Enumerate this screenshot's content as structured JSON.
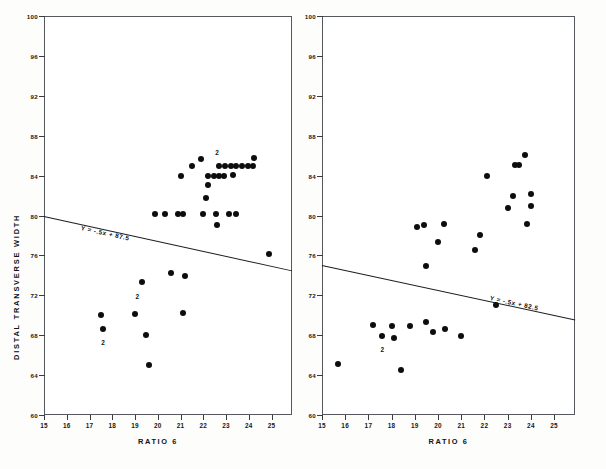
{
  "figure": {
    "background_color": "#ffffff",
    "point_color": "#0d0d0d",
    "axis_color": "#3a3d40"
  },
  "chart_data": [
    {
      "type": "scatter",
      "panel": "left",
      "title": "",
      "xlabel": "RATIO 6",
      "ylabel": "DISTAL TRANSVERSE WIDTH",
      "xlim": [
        15,
        25.9
      ],
      "ylim": [
        60,
        100
      ],
      "xticks": [
        15,
        16,
        17,
        18,
        19,
        20,
        21,
        22,
        23,
        24,
        25
      ],
      "yticks": [
        60,
        64,
        68,
        72,
        76,
        80,
        84,
        88,
        92,
        96,
        100
      ],
      "grid": false,
      "legend": null,
      "annotations": [
        {
          "text": "Y = -.5x + 87.5",
          "x": 16.6,
          "y": 79.0
        }
      ],
      "trendline": {
        "equation": "Y = -.5x + 87.5",
        "slope": -0.5,
        "intercept": 87.5,
        "x_start": 15.0,
        "y_start": 80.0,
        "x_end": 25.9,
        "y_end": 74.55
      },
      "points": [
        {
          "x": 17.5,
          "y": 70.0,
          "n": 1
        },
        {
          "x": 17.6,
          "y": 68.6,
          "n": 2,
          "count_label": "2"
        },
        {
          "x": 19.0,
          "y": 70.1,
          "n": 1
        },
        {
          "x": 19.3,
          "y": 73.3,
          "n": 1,
          "count_label": "2"
        },
        {
          "x": 19.5,
          "y": 68.0,
          "n": 1
        },
        {
          "x": 19.6,
          "y": 65.0,
          "n": 1
        },
        {
          "x": 19.9,
          "y": 80.2,
          "n": 1
        },
        {
          "x": 20.3,
          "y": 80.2,
          "n": 1
        },
        {
          "x": 20.6,
          "y": 74.2,
          "n": 1
        },
        {
          "x": 20.9,
          "y": 80.2,
          "n": 1
        },
        {
          "x": 21.1,
          "y": 80.2,
          "n": 1
        },
        {
          "x": 21.2,
          "y": 73.9,
          "n": 1
        },
        {
          "x": 21.1,
          "y": 70.2,
          "n": 1
        },
        {
          "x": 21.0,
          "y": 84.0,
          "n": 1
        },
        {
          "x": 21.5,
          "y": 85.0,
          "n": 1
        },
        {
          "x": 21.9,
          "y": 85.7,
          "n": 1
        },
        {
          "x": 22.2,
          "y": 83.1,
          "n": 1
        },
        {
          "x": 22.1,
          "y": 81.8,
          "n": 1
        },
        {
          "x": 22.2,
          "y": 84.0,
          "n": 1
        },
        {
          "x": 22.45,
          "y": 84.0,
          "n": 1
        },
        {
          "x": 22.7,
          "y": 84.0,
          "n": 1
        },
        {
          "x": 22.9,
          "y": 84.0,
          "n": 1
        },
        {
          "x": 22.55,
          "y": 80.2,
          "n": 1
        },
        {
          "x": 22.6,
          "y": 79.0,
          "n": 1
        },
        {
          "x": 22.0,
          "y": 80.2,
          "n": 1
        },
        {
          "x": 22.7,
          "y": 85.0,
          "n": 2,
          "count_label": "2"
        },
        {
          "x": 22.95,
          "y": 85.0,
          "n": 1
        },
        {
          "x": 23.2,
          "y": 85.0,
          "n": 1
        },
        {
          "x": 23.45,
          "y": 85.0,
          "n": 1
        },
        {
          "x": 23.7,
          "y": 85.0,
          "n": 1
        },
        {
          "x": 23.95,
          "y": 85.0,
          "n": 1
        },
        {
          "x": 24.2,
          "y": 85.0,
          "n": 1
        },
        {
          "x": 24.25,
          "y": 85.8,
          "n": 1
        },
        {
          "x": 23.3,
          "y": 84.1,
          "n": 1
        },
        {
          "x": 23.15,
          "y": 80.2,
          "n": 1
        },
        {
          "x": 23.45,
          "y": 80.2,
          "n": 1
        },
        {
          "x": 24.9,
          "y": 76.1,
          "n": 1
        }
      ],
      "count_markers": [
        {
          "text": "2",
          "x": 22.6,
          "y": 86.4
        },
        {
          "text": "2",
          "x": 19.1,
          "y": 71.9
        },
        {
          "text": "2",
          "x": 17.6,
          "y": 67.3
        }
      ]
    },
    {
      "type": "scatter",
      "panel": "right",
      "title": "",
      "xlabel": "RATIO 6",
      "ylabel": "",
      "xlim": [
        15,
        25.9
      ],
      "ylim": [
        60,
        100
      ],
      "xticks": [
        15,
        16,
        17,
        18,
        19,
        20,
        21,
        22,
        23,
        24,
        25
      ],
      "yticks": [
        60,
        64,
        68,
        72,
        76,
        80,
        84,
        88,
        92,
        96,
        100
      ],
      "grid": false,
      "legend": null,
      "annotations": [
        {
          "text": "Y = -.5x + 82.5",
          "x": 22.2,
          "y": 72.0
        }
      ],
      "trendline": {
        "equation": "Y = -.5x + 82.5",
        "slope": -0.5,
        "intercept": 82.5,
        "x_start": 15.0,
        "y_start": 75.0,
        "x_end": 25.9,
        "y_end": 69.55
      },
      "points": [
        {
          "x": 15.7,
          "y": 65.1,
          "n": 1
        },
        {
          "x": 17.2,
          "y": 69.0,
          "n": 1
        },
        {
          "x": 17.6,
          "y": 67.9,
          "n": 1,
          "count_label": "2"
        },
        {
          "x": 18.0,
          "y": 68.9,
          "n": 1
        },
        {
          "x": 18.1,
          "y": 67.7,
          "n": 1
        },
        {
          "x": 18.4,
          "y": 64.5,
          "n": 1
        },
        {
          "x": 18.8,
          "y": 68.9,
          "n": 1
        },
        {
          "x": 19.1,
          "y": 78.8,
          "n": 1
        },
        {
          "x": 19.4,
          "y": 79.0,
          "n": 1
        },
        {
          "x": 19.5,
          "y": 69.3,
          "n": 1
        },
        {
          "x": 19.5,
          "y": 74.9,
          "n": 1
        },
        {
          "x": 19.8,
          "y": 68.3,
          "n": 1
        },
        {
          "x": 20.0,
          "y": 77.3,
          "n": 1
        },
        {
          "x": 20.25,
          "y": 79.1,
          "n": 1
        },
        {
          "x": 20.3,
          "y": 68.6,
          "n": 1
        },
        {
          "x": 21.0,
          "y": 67.9,
          "n": 1
        },
        {
          "x": 21.6,
          "y": 76.5,
          "n": 1
        },
        {
          "x": 21.8,
          "y": 78.0,
          "n": 1
        },
        {
          "x": 22.1,
          "y": 84.0,
          "n": 1
        },
        {
          "x": 22.5,
          "y": 71.0,
          "n": 1
        },
        {
          "x": 23.0,
          "y": 80.8,
          "n": 1
        },
        {
          "x": 23.25,
          "y": 82.0,
          "n": 1
        },
        {
          "x": 23.3,
          "y": 85.1,
          "n": 1
        },
        {
          "x": 23.5,
          "y": 85.1,
          "n": 1
        },
        {
          "x": 23.75,
          "y": 86.1,
          "n": 1
        },
        {
          "x": 23.85,
          "y": 79.1,
          "n": 1
        },
        {
          "x": 24.0,
          "y": 81.0,
          "n": 1
        },
        {
          "x": 24.0,
          "y": 82.2,
          "n": 1
        }
      ],
      "count_markers": [
        {
          "text": "2",
          "x": 17.6,
          "y": 66.6
        }
      ]
    }
  ]
}
